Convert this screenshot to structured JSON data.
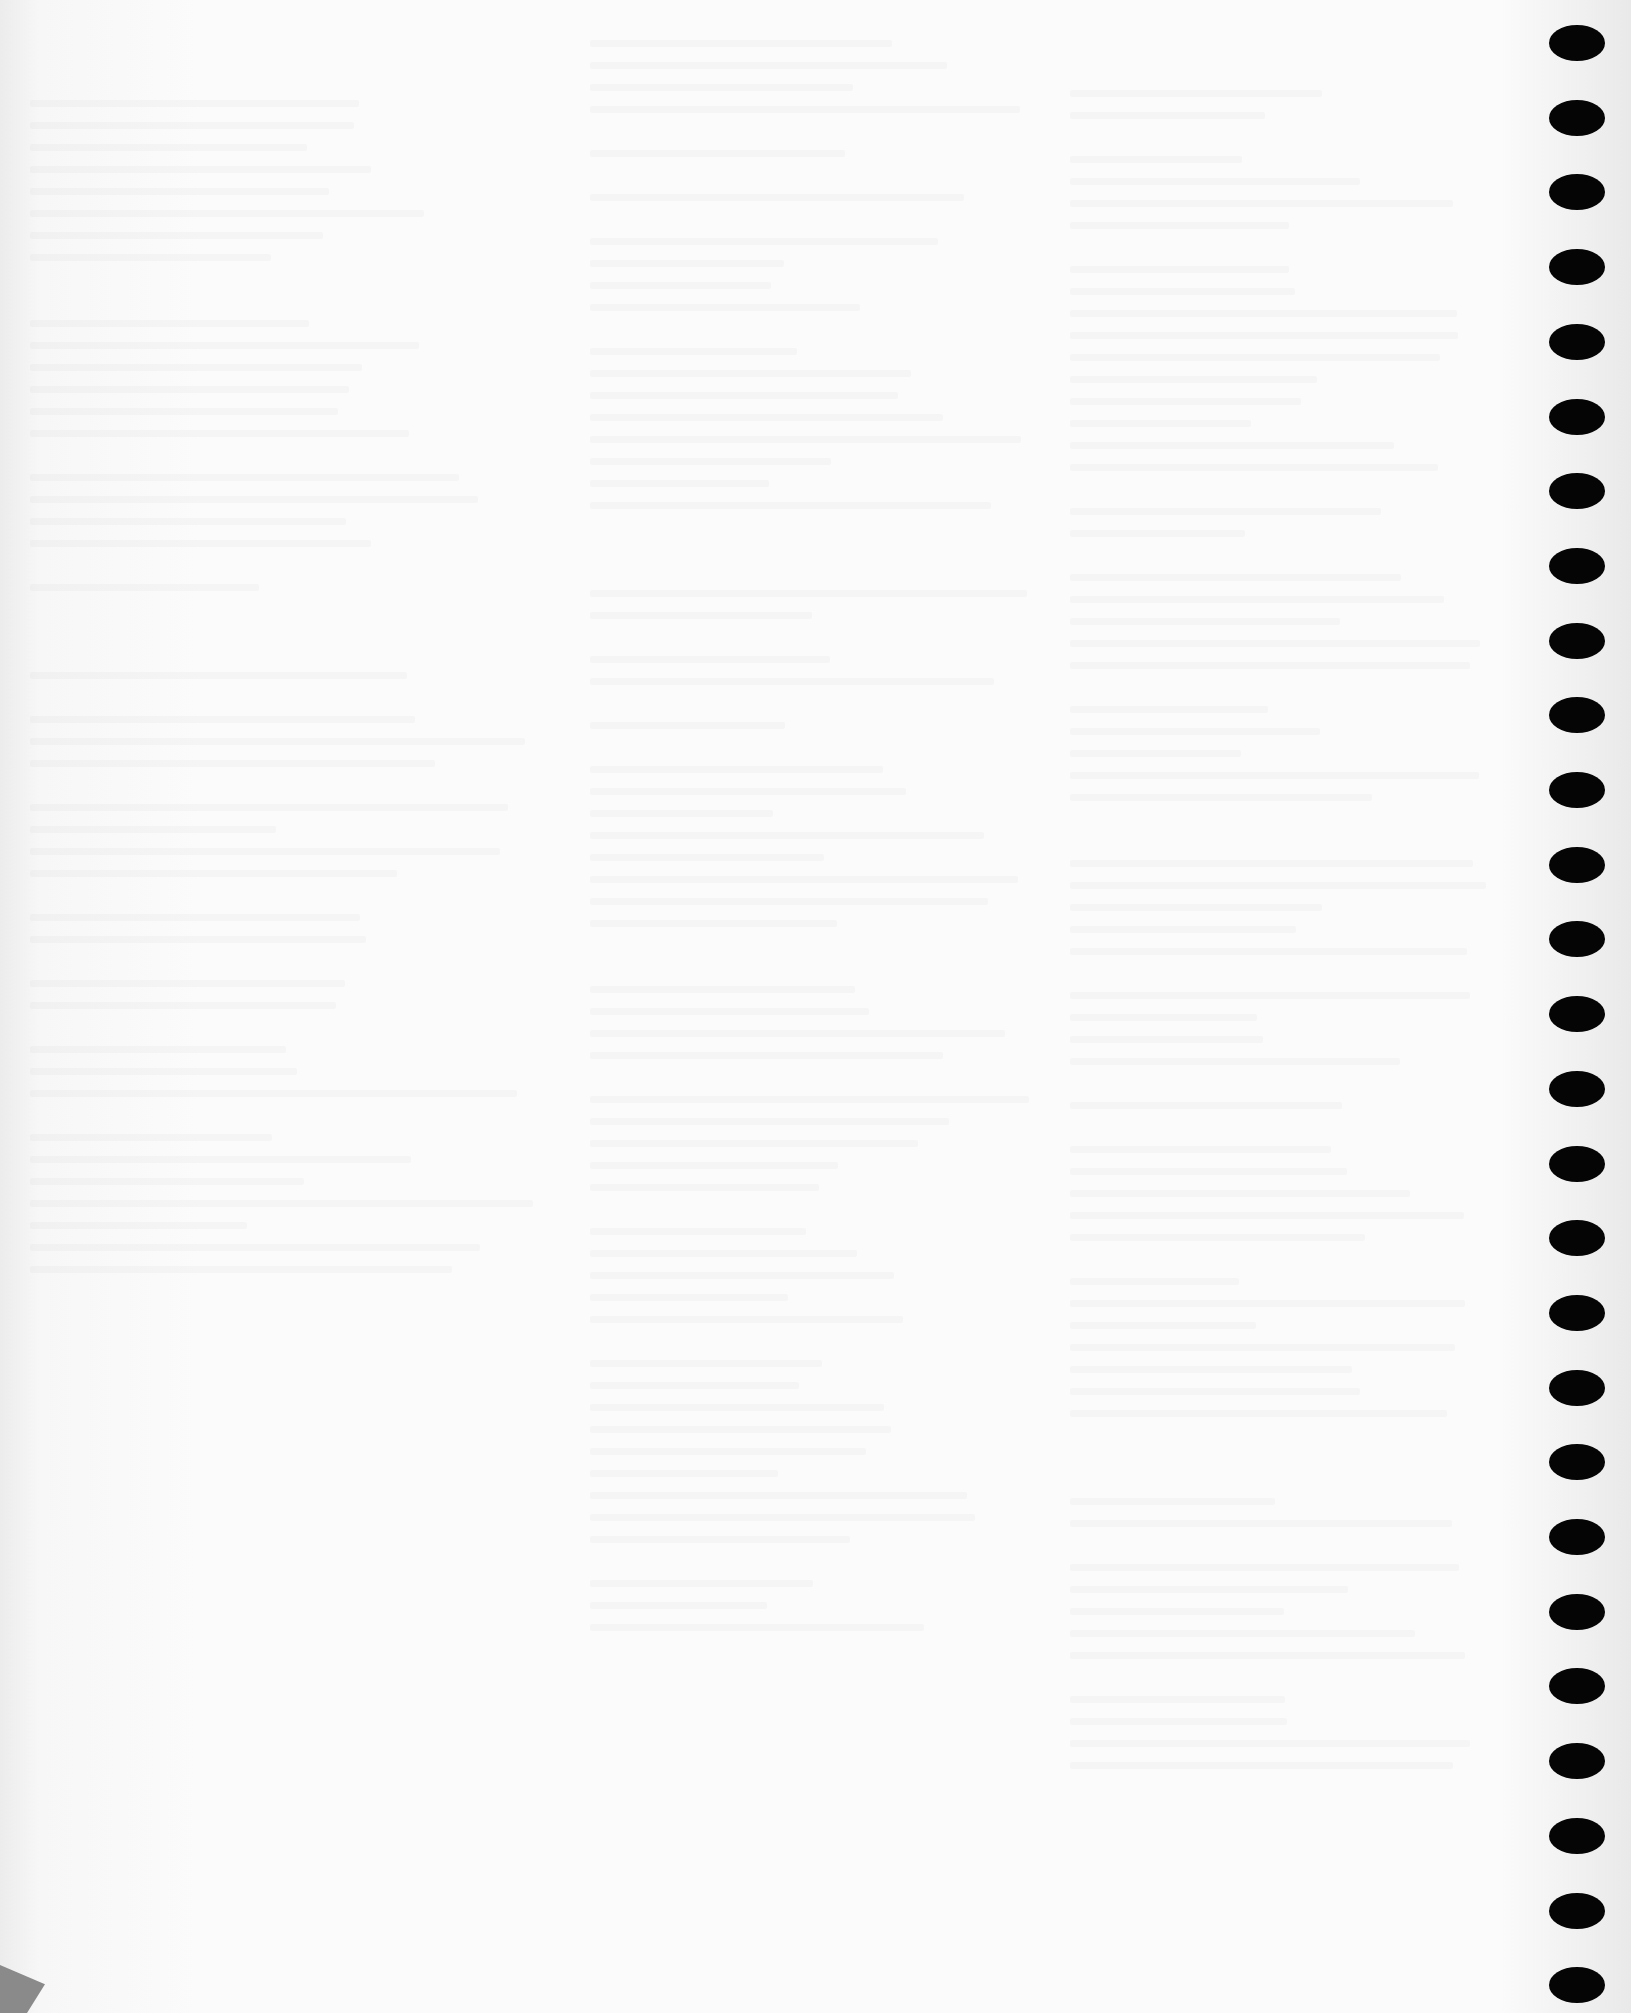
{
  "page": {
    "type": "scanned-blank-page",
    "background": "#fbfbfb",
    "text_legible": false
  },
  "binding_holes": {
    "count": 27,
    "color": "#050505",
    "x_center": 1577,
    "first_y_center": 43,
    "spacing": 74.7
  },
  "corner_mark": {
    "color": "#8a8a8a"
  },
  "ghost_columns": [
    {
      "x": 30,
      "y": 100,
      "w": 520,
      "h": 1250
    },
    {
      "x": 590,
      "y": 40,
      "w": 440,
      "h": 1600
    },
    {
      "x": 1070,
      "y": 90,
      "w": 420,
      "h": 1700
    }
  ]
}
